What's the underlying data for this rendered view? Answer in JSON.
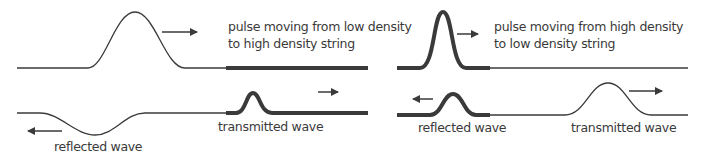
{
  "panels": {
    "left": {
      "title_line1": "pulse moving from low density",
      "title_line2": "to high density string",
      "incident_direction": "right",
      "reflected_label": "reflected wave",
      "reflected_direction": "left",
      "reflected_orientation": "inverted",
      "transmitted_label": "transmitted wave",
      "transmitted_direction": "right"
    },
    "right": {
      "title_line1": "pulse moving from high density",
      "title_line2": "to low density string",
      "incident_direction": "right",
      "reflected_label": "reflected wave",
      "reflected_direction": "left",
      "reflected_orientation": "upright",
      "transmitted_label": "transmitted wave",
      "transmitted_direction": "right"
    }
  },
  "colors": {
    "string_color": "#3a3a3a",
    "text_color": "#3a3a3a"
  }
}
